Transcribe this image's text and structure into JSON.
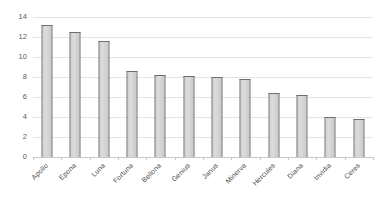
{
  "chart_data": {
    "type": "bar",
    "title": "",
    "subtitle": "",
    "xlabel": "",
    "ylabel": "",
    "ylim": [
      0,
      14
    ],
    "ytick_step": 2,
    "yticks": [
      0,
      2,
      4,
      6,
      8,
      10,
      12,
      14
    ],
    "grid": "horizontal",
    "legend": "none",
    "bar_fill_color": "#d4d4d4",
    "bar_border_color": "#6e6e6e",
    "gridline_color": "#e4e4e4",
    "axis_color": "#c8c8c8",
    "tick_label_color": "#4a4a4a",
    "categories": [
      "Apollo",
      "Epona",
      "Luna",
      "Fortuna",
      "Bellona",
      "Genius",
      "Janus",
      "Minerva",
      "Hercules",
      "Diana",
      "Invidia",
      "Ceres"
    ],
    "values": [
      13.2,
      12.5,
      11.6,
      8.6,
      8.2,
      8.1,
      8.0,
      7.8,
      6.4,
      6.2,
      4.0,
      3.8
    ],
    "series": [
      {
        "name": "",
        "values": [
          13.2,
          12.5,
          11.6,
          8.6,
          8.2,
          8.1,
          8.0,
          7.8,
          6.4,
          6.2,
          4.0,
          3.8
        ]
      }
    ]
  }
}
